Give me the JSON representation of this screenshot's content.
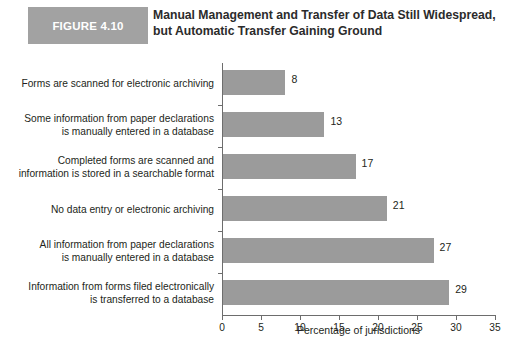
{
  "header": {
    "badge_label": "FIGURE 4.10",
    "badge_color": "#a2a2a2",
    "title_line1": "Manual Management and Transfer of Data Still Widespread,",
    "title_line2": "but Automatic Transfer Gaining Ground"
  },
  "chart_data": {
    "type": "bar",
    "orientation": "horizontal",
    "title": "Manual Management and Transfer of Data Still Widespread, but Automatic Transfer Gaining Ground",
    "xlabel": "Percentage of jurisdictions",
    "ylabel": "",
    "xlim": [
      0,
      35
    ],
    "xticks": [
      0,
      5,
      10,
      15,
      20,
      25,
      30,
      35
    ],
    "xtick_labels": [
      "0",
      "5",
      "10",
      "15",
      "20",
      "25",
      "30",
      "35"
    ],
    "grid": false,
    "legend": null,
    "bar_color": "#9b9b9b",
    "categories": [
      "Forms are scanned for electronic archiving",
      "Some information from paper declarations is manually entered in a database",
      "Completed forms are scanned and information is stored in a searchable format",
      "No data entry or electronic archiving",
      "All information from paper declarations is manually entered in a database",
      "Information from forms filed electronically is transferred to a database"
    ],
    "category_lines": [
      [
        "Forms are scanned for electronic archiving"
      ],
      [
        "Some information from paper declarations",
        "is manually entered in a database"
      ],
      [
        "Completed forms are scanned and",
        "information is stored in a searchable format"
      ],
      [
        "No data entry or electronic archiving"
      ],
      [
        "All information from paper declarations",
        "is manually entered in a database"
      ],
      [
        "Information from forms filed electronically",
        "is transferred to a database"
      ]
    ],
    "values": [
      8,
      13,
      17,
      21,
      27,
      29
    ],
    "value_labels": [
      "8",
      "13",
      "17",
      "21",
      "27",
      "29"
    ]
  }
}
